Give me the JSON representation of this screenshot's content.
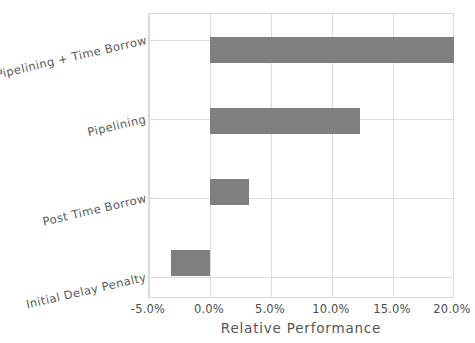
{
  "chart_data": {
    "type": "bar",
    "orientation": "horizontal",
    "title": "",
    "subtitle": "",
    "xlabel": "Relative Performance",
    "ylabel": "",
    "categories": [
      "Pipelining + Time Borrow",
      "Pipelining",
      "Post Time Borrow",
      "Initial Delay Penalty"
    ],
    "values": [
      0.199,
      0.122,
      0.032,
      -0.032
    ],
    "value_labels": [
      "19.9%",
      "12.2%",
      "3.2%",
      "-3.2%"
    ],
    "series": [
      {
        "name": "Relative Performance",
        "values": [
          0.199,
          0.122,
          0.032,
          -0.032
        ]
      }
    ],
    "xlim": [
      -0.05,
      0.2
    ],
    "xticks": [
      -0.05,
      0.0,
      0.05,
      0.1,
      0.15,
      0.2
    ],
    "xtick_labels": [
      "-5.0%",
      "0.0%",
      "5.0%",
      "10.0%",
      "15.0%",
      "20.0%"
    ],
    "grid": true,
    "legend": null,
    "bar_color": "#7f7f7f",
    "grid_color": "#dcdcdc",
    "axis_border_color": "#d9d9d9",
    "background_color": "#ffffff",
    "tick_text_color": "#4d4d4d",
    "axis_title_color": "#555555",
    "category_label_color": "#5a5a5a",
    "category_label_rotation_deg": -13
  }
}
